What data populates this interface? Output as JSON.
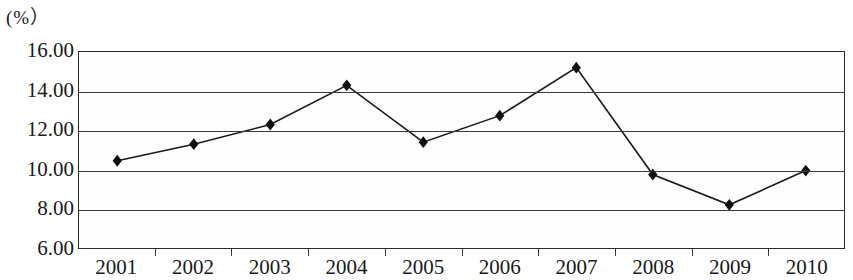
{
  "chart_data": {
    "type": "line",
    "title": "",
    "subtitle": "",
    "unit_label": "(%）",
    "xlabel": "",
    "ylabel": "",
    "categories": [
      "2001",
      "2002",
      "2003",
      "2004",
      "2005",
      "2006",
      "2007",
      "2008",
      "2009",
      "2010"
    ],
    "values": [
      10.45,
      11.3,
      12.3,
      14.3,
      11.4,
      12.75,
      15.2,
      9.75,
      8.2,
      9.95
    ],
    "series": [
      {
        "name": "",
        "values": [
          10.45,
          11.3,
          12.3,
          14.3,
          11.4,
          12.75,
          15.2,
          9.75,
          8.2,
          9.95
        ]
      }
    ],
    "ylim": [
      6.0,
      16.0
    ],
    "ytick_labels": [
      "16.00",
      "14.00",
      "12.00",
      "10.00",
      "8.00",
      "6.00"
    ],
    "ytick_values": [
      16.0,
      14.0,
      12.0,
      10.0,
      8.0,
      6.0
    ],
    "grid": true,
    "legend": "none",
    "marker": "diamond",
    "line_color": "#1a1a1a",
    "marker_color": "#101010",
    "grid_color": "#3a3a3a",
    "plot_background": "#fefefe"
  }
}
